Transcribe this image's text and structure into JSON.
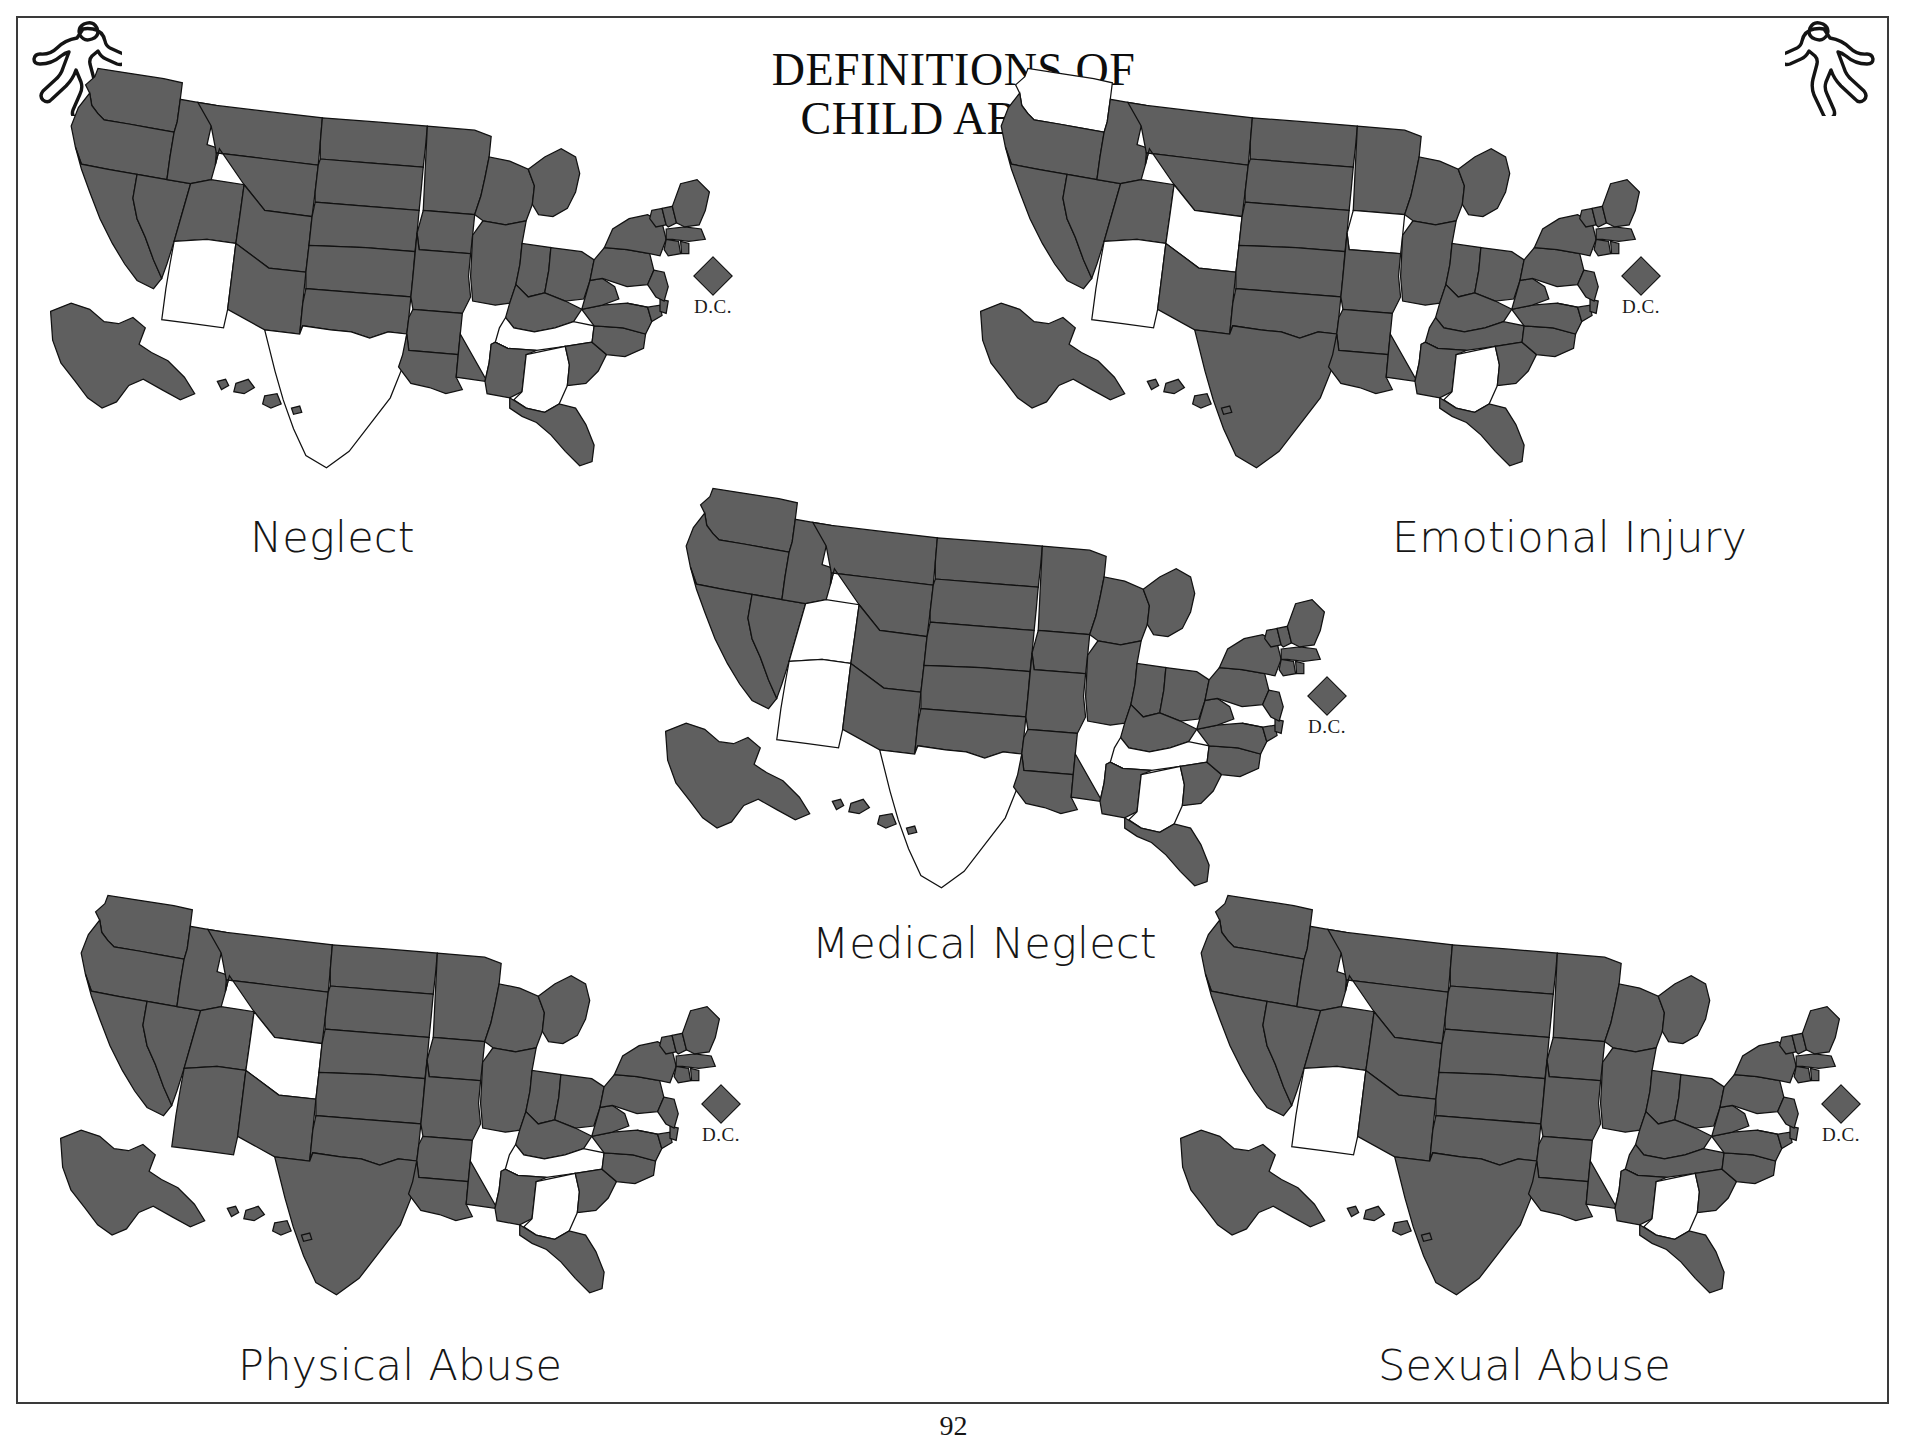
{
  "document": {
    "title_lines": [
      "DEFINITIONS OF",
      "CHILD ABUSE"
    ],
    "page_number": "92",
    "colors": {
      "state_filled": "#5f5f5f",
      "state_empty": "#ffffff",
      "outline": "#111111",
      "frame": "#3a3a3a"
    },
    "decorations": {
      "corner_left": "running-figure-icon",
      "corner_right": "running-figure-icon"
    }
  },
  "dc_marker": {
    "label": "D.C.",
    "shape": "diamond",
    "state": "filled"
  },
  "legend": {
    "filled_means": "definition includes this category",
    "empty_means": "definition does not include this category"
  },
  "chart_data": {
    "type": "map",
    "title": "DEFINITIONS OF CHILD ABUSE",
    "subtitle": "",
    "geography": "United States (50 states plus District of Columbia)",
    "encoding": {
      "filled": "#5f5f5f",
      "empty": "#ffffff"
    },
    "maps": [
      {
        "id": "neglect",
        "label": "Neglect",
        "position": "top-left",
        "excluded_states": [
          "AZ",
          "TX",
          "TN",
          "GA"
        ],
        "excluded_count": 4,
        "included_count": 47,
        "dc_included": true
      },
      {
        "id": "emotional-injury",
        "label": "Emotional Injury",
        "position": "top-right",
        "excluded_states": [
          "WA",
          "IA",
          "CO",
          "AZ",
          "GA"
        ],
        "excluded_count": 5,
        "included_count": 46,
        "dc_included": true
      },
      {
        "id": "medical-neglect",
        "label": "Medical Neglect",
        "position": "center",
        "excluded_states": [
          "UT",
          "AZ",
          "TX",
          "TN",
          "GA"
        ],
        "excluded_count": 5,
        "included_count": 46,
        "dc_included": true
      },
      {
        "id": "physical-abuse",
        "label": "Physical Abuse",
        "position": "bottom-left",
        "excluded_states": [
          "CO",
          "TN",
          "GA"
        ],
        "excluded_count": 3,
        "included_count": 48,
        "dc_included": true
      },
      {
        "id": "sexual-abuse",
        "label": "Sexual Abuse",
        "position": "bottom-right",
        "excluded_states": [
          "AZ",
          "GA"
        ],
        "excluded_count": 2,
        "included_count": 49,
        "dc_included": true
      }
    ]
  }
}
